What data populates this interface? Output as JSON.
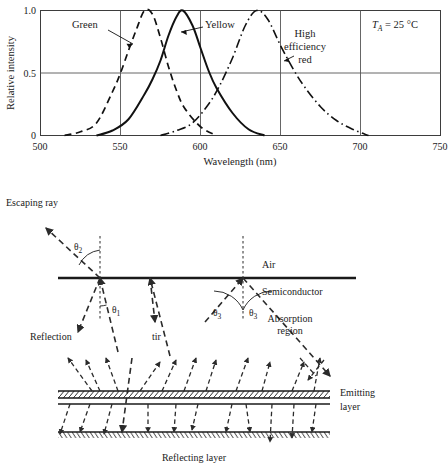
{
  "chart_data": {
    "type": "line",
    "title": "",
    "xlabel": "Wavelength (nm)",
    "ylabel": "Relative intensity",
    "xlim": [
      500,
      750
    ],
    "ylim": [
      0,
      1.0
    ],
    "xticks": [
      500,
      550,
      600,
      650,
      700,
      750
    ],
    "yticks": [
      0,
      0.5,
      1.0
    ],
    "xtick_labels": [
      "500",
      "550",
      "600",
      "650",
      "700",
      "750"
    ],
    "ytick_labels": [
      "0",
      "0.5",
      "1.0"
    ],
    "grid": true,
    "legend_position": "inline-annotations",
    "annotation": "T_A = 25 °C",
    "annotation_symbol": "T",
    "annotation_sub": "A",
    "annotation_value": " = 25 °C",
    "series": [
      {
        "name": "Green",
        "style": "dashed",
        "peak_nm": 565,
        "peak_value": 1.0,
        "fwhm_nm": 30,
        "label": "Green",
        "points_nm": [
          515,
          525,
          535,
          545,
          550,
          555,
          560,
          565,
          570,
          575,
          580,
          585,
          590,
          600,
          610
        ],
        "points_intensity": [
          0.0,
          0.03,
          0.1,
          0.35,
          0.5,
          0.68,
          0.85,
          1.0,
          0.97,
          0.78,
          0.55,
          0.36,
          0.22,
          0.07,
          0.0
        ]
      },
      {
        "name": "Yellow",
        "style": "solid",
        "peak_nm": 589,
        "peak_value": 1.0,
        "fwhm_nm": 33,
        "label": "Yellow",
        "points_nm": [
          535,
          545,
          555,
          565,
          570,
          575,
          580,
          585,
          589,
          595,
          600,
          605,
          610,
          620,
          630,
          640
        ],
        "points_intensity": [
          0.0,
          0.04,
          0.13,
          0.33,
          0.45,
          0.6,
          0.8,
          0.95,
          1.0,
          0.88,
          0.7,
          0.52,
          0.38,
          0.18,
          0.05,
          0.0
        ]
      },
      {
        "name": "High efficiency red",
        "style": "dash-dot",
        "peak_nm": 635,
        "peak_value": 1.0,
        "fwhm_nm": 40,
        "label_line1": "High",
        "label_line2": "efficiency",
        "label_line3": "red",
        "points_nm": [
          575,
          585,
          595,
          605,
          612,
          620,
          628,
          635,
          642,
          650,
          658,
          665,
          675,
          685,
          695,
          705
        ],
        "points_intensity": [
          0.0,
          0.04,
          0.1,
          0.25,
          0.4,
          0.62,
          0.88,
          1.0,
          0.93,
          0.72,
          0.53,
          0.39,
          0.23,
          0.12,
          0.05,
          0.0
        ]
      }
    ]
  },
  "diagram": {
    "labels": {
      "escaping_ray": "Escaping ray",
      "reflection": "Reflection",
      "tir": "tir",
      "air": "Air",
      "semiconductor": "Semiconductor",
      "absorption_line1": "Absorption",
      "absorption_line2": "region",
      "emitting_line1": "Emitting",
      "emitting_line2": "layer",
      "reflecting_layer": "Reflecting layer",
      "theta_symbol": "θ",
      "theta1_sub": "1",
      "theta2_sub": "2",
      "theta3_sub": "3",
      "theta3b_sub": "3"
    }
  },
  "colors": {
    "stroke": "#1a1a1a",
    "grid": "#555555",
    "background": "#ffffff"
  }
}
